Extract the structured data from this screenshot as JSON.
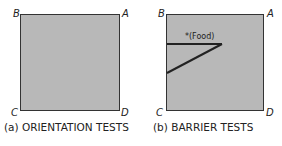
{
  "panels": [
    {
      "id": "a",
      "caption": "(a) ORIENTATION TESTS",
      "corners": {
        "top_left": "B",
        "top_right": "A",
        "bottom_left": "C",
        "bottom_right": "D"
      }
    },
    {
      "id": "b",
      "caption": "(b) BARRIER TESTS",
      "corners": {
        "top_left": "B",
        "top_right": "A",
        "bottom_left": "C",
        "bottom_right": "D"
      },
      "food_label": "*(Food)"
    }
  ]
}
